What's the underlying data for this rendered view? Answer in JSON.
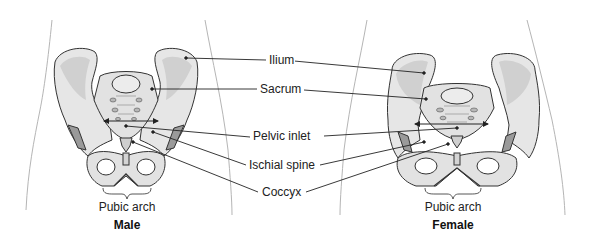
{
  "figure": {
    "type": "anatomical-comparison"
  },
  "labels": {
    "ilium": "Ilium",
    "sacrum": "Sacrum",
    "pelvic_inlet": "Pelvic inlet",
    "ischial_spine": "Ischial spine",
    "coccyx": "Coccyx"
  },
  "male": {
    "title": "Male",
    "pubic_arch": "Pubic arch"
  },
  "female": {
    "title": "Female",
    "pubic_arch": "Pubic arch"
  },
  "colors": {
    "bone_fill": "#e6e6e6",
    "bone_shade": "#c8c8c8",
    "cartilage": "#9a9a9a",
    "outline": "#333333",
    "body_outline": "#b0b0b0",
    "leader_line": "#222222"
  }
}
